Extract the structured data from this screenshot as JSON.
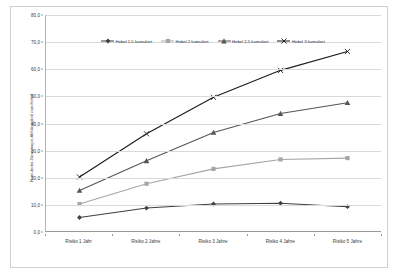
{
  "chart_data": {
    "type": "line",
    "title": "",
    "xlabel": "",
    "ylabel": "Kumulierter Zinsertrag in Abhängigkeit vom Hebel",
    "categories": [
      "Risiko 1 Jahr",
      "Risiko 2 Jahre",
      "Risiko 3 Jahre",
      "Risiko 4 Jahre",
      "Risiko 5 Jahre"
    ],
    "ylim": [
      0,
      80
    ],
    "yticks": [
      "0,0",
      "10,0",
      "20,0",
      "30,0",
      "40,0",
      "50,0",
      "60,0",
      "70,0",
      "80,0"
    ],
    "ytick_values": [
      0,
      10,
      20,
      30,
      40,
      50,
      60,
      70,
      80
    ],
    "grid": true,
    "legend_position": "top-center",
    "series": [
      {
        "name": "Hebel 1,5 kumuliert",
        "values": [
          5.0,
          8.5,
          10.0,
          10.3,
          9.0
        ],
        "color": "#3f3f3f",
        "marker": "diamond"
      },
      {
        "name": "Hebel 2 kumuliert",
        "values": [
          10.0,
          17.5,
          23.0,
          26.5,
          27.0
        ],
        "color": "#a6a6a6",
        "marker": "square"
      },
      {
        "name": "Hebel 2,5 kumuliert",
        "values": [
          15.0,
          26.0,
          36.5,
          43.5,
          47.5
        ],
        "color": "#555555",
        "marker": "triangle"
      },
      {
        "name": "Hebel 3 kumuliert",
        "values": [
          20.0,
          36.0,
          49.5,
          59.5,
          66.5
        ],
        "color": "#1a1a1a",
        "marker": "cross"
      }
    ]
  }
}
